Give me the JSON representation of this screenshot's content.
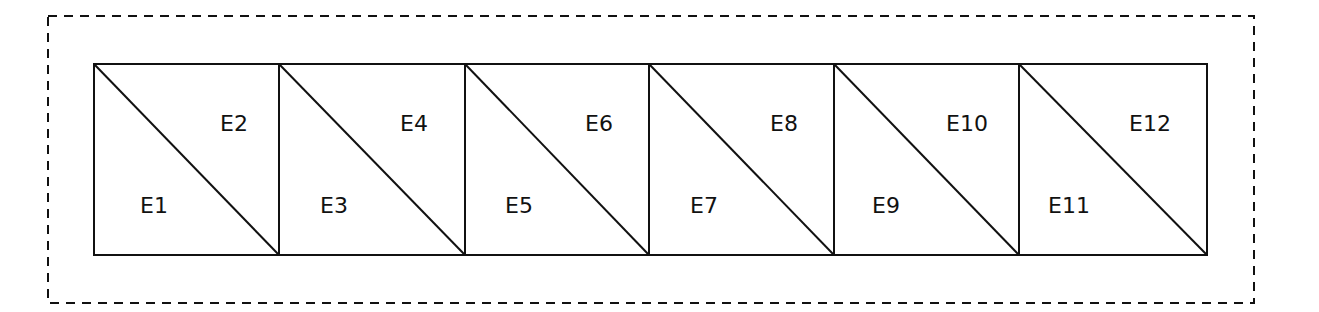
{
  "diagram": {
    "type": "triangulated-strip",
    "boundary": {
      "style": "dashed",
      "x": 48,
      "y": 16,
      "width": 1206,
      "height": 287
    },
    "strip": {
      "x": 94,
      "y": 64,
      "width": 1113,
      "height": 191,
      "cells": 6
    },
    "stroke_color": "#111111",
    "cells": [
      {
        "lower": "E1",
        "upper": "E2"
      },
      {
        "lower": "E3",
        "upper": "E4"
      },
      {
        "lower": "E5",
        "upper": "E6"
      },
      {
        "lower": "E7",
        "upper": "E8"
      },
      {
        "lower": "E9",
        "upper": "E10"
      },
      {
        "lower": "E11",
        "upper": "E12"
      }
    ]
  }
}
